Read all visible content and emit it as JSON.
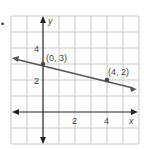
{
  "bullet": "•",
  "graph": {
    "x_axis_label": "x",
    "y_axis_label": "y",
    "x_range": [
      -2,
      6
    ],
    "y_range": [
      -2,
      6
    ],
    "x_tick_labels": [
      "2",
      "4"
    ],
    "y_tick_labels": [
      "2",
      "4"
    ],
    "points": [
      {
        "label": "(0, 3)",
        "x": 0,
        "y": 3
      },
      {
        "label": "(4, 2)",
        "x": 4,
        "y": 2
      }
    ],
    "line": {
      "slope": -0.25,
      "intercept": 3
    },
    "colors": {
      "grid": "#c8c8c8",
      "axis": "#222222",
      "line": "#555555",
      "text": "#444444"
    }
  }
}
